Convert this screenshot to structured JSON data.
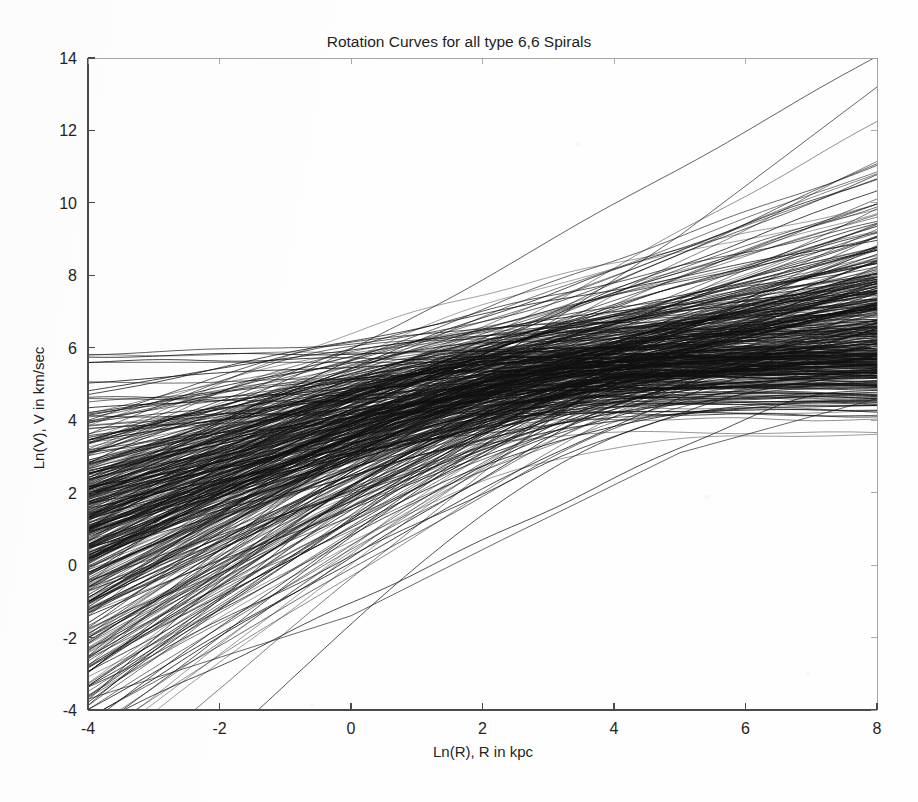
{
  "figure": {
    "background_color": "#fefefe",
    "ink_color": "#101010",
    "axis_color": "#4a4a4a",
    "width": 918,
    "height": 802
  },
  "chart_data": {
    "type": "line",
    "title": "Rotation Curves for all type 6,6 Spirals",
    "xlabel": "Ln(R), R in kpc",
    "ylabel": "Ln(V), V in km/sec",
    "xlim": [
      -4,
      8
    ],
    "ylim": [
      -4,
      14
    ],
    "xticks": [
      -4,
      -2,
      0,
      2,
      4,
      6,
      8
    ],
    "yticks": [
      -4,
      -2,
      0,
      2,
      4,
      6,
      8,
      10,
      12,
      14
    ],
    "xtick_labels": [
      "-4",
      "-2",
      "0",
      "2",
      "4",
      "6",
      "8"
    ],
    "ytick_labels": [
      "-4",
      "-2",
      "0",
      "2",
      "4",
      "6",
      "8",
      "10",
      "12",
      "14"
    ],
    "grid": false,
    "legend": false,
    "legend_position": "none",
    "series_count": 420,
    "series_description": "Overplotted logarithmic rotation curves for type 6,6 spiral galaxies; each curve rises steeply at small Ln(R), converges toward a common waist and then fans out at large Ln(R).",
    "waist": {
      "x": 2.3,
      "y": 5.5
    },
    "envelope": {
      "left_edge_x": -4,
      "left_edge_y_min": -3.7,
      "left_edge_y_max": 5.6,
      "right_edge_x": 8,
      "right_edge_y_min": 4.4,
      "right_edge_y_max": 13.2,
      "dense_band_left": [
        0.4,
        4.9
      ],
      "dense_band_right": [
        5.3,
        8.6
      ]
    },
    "series": [
      {
        "name": "envelope-upper-left",
        "x": [
          -4,
          0,
          2.3,
          5,
          8
        ],
        "values": [
          5.6,
          5.6,
          5.6,
          5.6,
          5.6
        ]
      },
      {
        "name": "envelope-lower-left",
        "x": [
          -4,
          0,
          2.3,
          5,
          8
        ],
        "values": [
          -3.7,
          -1.4,
          0.7,
          3.1,
          4.6
        ]
      },
      {
        "name": "envelope-upper-right",
        "x": [
          -4,
          0,
          2.3,
          5,
          8
        ],
        "values": [
          2.9,
          4.6,
          5.8,
          9.1,
          13.2
        ]
      },
      {
        "name": "envelope-lower-right",
        "x": [
          -4,
          0,
          2.3,
          5,
          8
        ],
        "values": [
          4.6,
          4.5,
          4.5,
          4.45,
          4.4
        ]
      },
      {
        "name": "median-curve",
        "x": [
          -4,
          0,
          2.3,
          5,
          8
        ],
        "values": [
          2.1,
          3.9,
          5.3,
          6.4,
          7.1
        ]
      }
    ],
    "generator": {
      "note": "Curve family is reconstructed parametrically from the envelope description above.",
      "n_curves": 420,
      "seed": 20240611,
      "knee_x_mean": 2.3,
      "knee_x_spread": 1.15,
      "plateau_mean": 5.45,
      "plateau_spread": 0.62,
      "inner_slope_mean": 0.78,
      "inner_slope_spread": 0.3,
      "outer_slope_mean": 0.16,
      "outer_slope_spread": 0.3
    }
  }
}
